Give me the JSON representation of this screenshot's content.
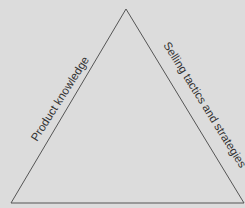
{
  "diagram": {
    "shape": "triangle",
    "colors": {
      "background": "#dcdcdc",
      "stroke": "#555555",
      "text": "#333333"
    },
    "sides": {
      "left": {
        "label": "Product knowledge"
      },
      "right": {
        "label": "Selling tactics and strategies"
      },
      "bottom": {
        "label": ""
      }
    }
  }
}
